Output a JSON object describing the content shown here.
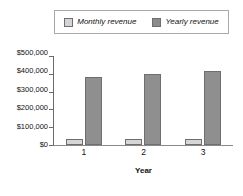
{
  "chart_data": {
    "type": "bar",
    "title": "",
    "subtitle": "",
    "xlabel": "Year",
    "ylabel": "",
    "categories": [
      "1",
      "2",
      "3"
    ],
    "series": [
      {
        "name": "Monthly revenue",
        "values": [
          32000,
          33000,
          35000
        ],
        "color": "#d6d6d6"
      },
      {
        "name": "Yearly revenue",
        "values": [
          380000,
          400000,
          415000
        ],
        "color": "#8f8f8f"
      }
    ],
    "ylim": [
      0,
      500000
    ],
    "ytick_values": [
      0,
      100000,
      200000,
      300000,
      400000,
      500000
    ],
    "ytick_labels": [
      "$0",
      "$100,000",
      "$200,000",
      "$300,000",
      "$400,000",
      "$500,000"
    ],
    "grid": false,
    "legend_position": "top"
  },
  "legend": {
    "entries": [
      {
        "label": "Monthly revenue",
        "swatch": "legend-swatch-monthly"
      },
      {
        "label": "Yearly revenue",
        "swatch": "legend-swatch-yearly"
      }
    ]
  },
  "axes": {
    "y_tick_labels": [
      "$500,000",
      "$400,000",
      "$300,000",
      "$200,000",
      "$100,000",
      "$0"
    ],
    "x_tick_labels": [
      "1",
      "2",
      "3"
    ],
    "x_axis_title": "Year"
  },
  "colors": {
    "monthly": "#d6d6d6",
    "yearly": "#8f8f8f",
    "axis": "#6b6b6b",
    "legend_border": "#a8a8a8",
    "background": "#ffffff"
  }
}
